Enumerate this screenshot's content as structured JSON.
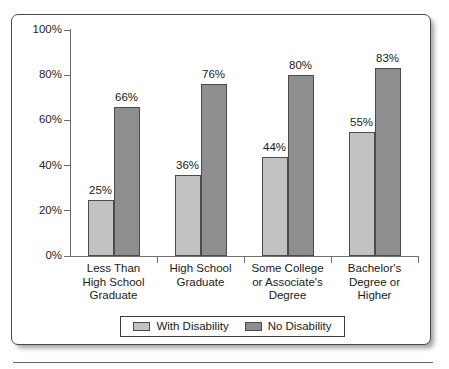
{
  "chart_data": {
    "type": "bar",
    "title": "",
    "subtitle": "",
    "xlabel": "",
    "ylabel": "",
    "ylim": [
      0,
      100
    ],
    "y_ticks": [
      "0%",
      "20%",
      "40%",
      "60%",
      "80%",
      "100%"
    ],
    "y_tick_values": [
      0,
      20,
      40,
      60,
      80,
      100
    ],
    "grid": false,
    "legend_position": "bottom",
    "categories": [
      "Less Than High School Graduate",
      "High School Graduate",
      "Some College or Associate's Degree",
      "Bachelor's Degree or Higher"
    ],
    "category_label_lines": [
      [
        "Less Than",
        "High School",
        "Graduate"
      ],
      [
        "High School",
        "Graduate"
      ],
      [
        "Some College",
        "or Associate's",
        "Degree"
      ],
      [
        "Bachelor's",
        "Degree or",
        "Higher"
      ]
    ],
    "series": [
      {
        "name": "With Disability",
        "color": "#c2c2c2",
        "values": [
          25,
          36,
          44,
          55
        ],
        "value_labels": [
          "25%",
          "36%",
          "44%",
          "55%"
        ]
      },
      {
        "name": "No Disability",
        "color": "#8e8e8e",
        "values": [
          66,
          76,
          80,
          83
        ],
        "value_labels": [
          "66%",
          "76%",
          "80%",
          "83%"
        ]
      }
    ]
  },
  "legend": {
    "items": [
      {
        "label": "With Disability",
        "swatch": "light"
      },
      {
        "label": "No Disability",
        "swatch": "dark"
      }
    ]
  },
  "colors": {
    "with_disability": "#c2c2c2",
    "no_disability": "#8e8e8e",
    "axis": "#6e6e6e",
    "frame": "#4a4a4a",
    "text": "#1a1a1a"
  }
}
